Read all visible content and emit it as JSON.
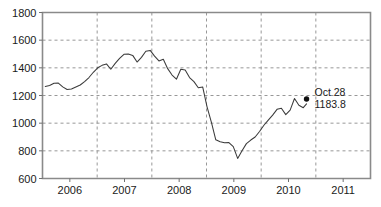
{
  "chart_data": {
    "type": "line",
    "title": "",
    "subtitle": "",
    "xlabel": "",
    "ylabel": "",
    "xlim": [
      2005.5,
      2011.5
    ],
    "ylim": [
      600,
      1800
    ],
    "grid": true,
    "legend_position": "none",
    "y_ticks": [
      600,
      800,
      1000,
      1200,
      1400,
      1600,
      1800
    ],
    "y_tick_labels": [
      "600",
      "800",
      "1000",
      "1200",
      "1400",
      "1600",
      "1800"
    ],
    "x_ticks": [
      2006,
      2007,
      2008,
      2009,
      2010,
      2011
    ],
    "x_tick_labels": [
      "2006",
      "2007",
      "2008",
      "2009",
      "2010",
      "2011"
    ],
    "x_gridlines": [
      2006.5,
      2007.5,
      2008.5,
      2009.5,
      2010.5
    ],
    "series": [
      {
        "name": "index",
        "color": "#3b3b3b",
        "x": [
          2005.55,
          2005.63,
          2005.71,
          2005.79,
          2005.87,
          2005.95,
          2006.03,
          2006.11,
          2006.19,
          2006.27,
          2006.35,
          2006.43,
          2006.51,
          2006.59,
          2006.67,
          2006.75,
          2006.83,
          2006.91,
          2006.99,
          2007.07,
          2007.15,
          2007.23,
          2007.31,
          2007.39,
          2007.47,
          2007.55,
          2007.63,
          2007.71,
          2007.79,
          2007.87,
          2007.95,
          2008.03,
          2008.11,
          2008.19,
          2008.27,
          2008.35,
          2008.43,
          2008.51,
          2008.59,
          2008.67,
          2008.75,
          2008.83,
          2008.91,
          2008.99,
          2009.07,
          2009.15,
          2009.23,
          2009.31,
          2009.39,
          2009.47,
          2009.55,
          2009.63,
          2009.71,
          2009.79,
          2009.87,
          2009.95,
          2010.03,
          2010.11,
          2010.19,
          2010.27,
          2010.33
        ],
        "y": [
          1265,
          1272,
          1288,
          1290,
          1262,
          1243,
          1247,
          1262,
          1276,
          1300,
          1330,
          1368,
          1400,
          1418,
          1428,
          1390,
          1432,
          1468,
          1498,
          1500,
          1490,
          1442,
          1476,
          1520,
          1526,
          1485,
          1450,
          1462,
          1394,
          1348,
          1318,
          1390,
          1384,
          1330,
          1300,
          1256,
          1262,
          1118,
          1005,
          880,
          866,
          858,
          860,
          830,
          745,
          800,
          852,
          878,
          900,
          940,
          985,
          1022,
          1058,
          1100,
          1108,
          1062,
          1094,
          1178,
          1130,
          1112,
          1140
        ]
      }
    ],
    "annotations": [
      {
        "name": "latest-point",
        "label_line1": "Oct 28",
        "label_line2": "1183.8",
        "x": 2010.33,
        "y": 1175,
        "marker": "dot",
        "marker_color": "#101010"
      }
    ]
  },
  "chart": {
    "axis_color": "#8a8a8a",
    "grid_color": "#8c8c8c",
    "line_color": "#3b3b3b",
    "background": "#ffffff"
  }
}
